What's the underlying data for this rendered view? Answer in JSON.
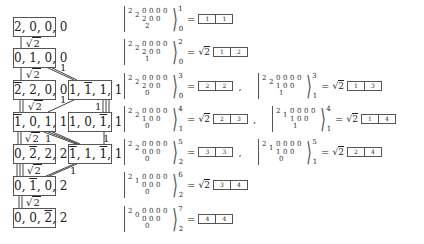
{
  "graph": {
    "nodes": [
      {
        "id": "n1",
        "parts": [
          {
            "t": "2"
          },
          {
            "t": ", 0, 0, 0"
          }
        ],
        "x": 13,
        "y": 17,
        "w": 43
      },
      {
        "id": "n2",
        "parts": [
          {
            "t": "0, 1, 0, 0"
          }
        ],
        "x": 13,
        "y": 48,
        "w": 43
      },
      {
        "id": "n3",
        "parts": [
          {
            "t": "2",
            "bar": true
          },
          {
            "t": ", 2, 0, 0"
          }
        ],
        "x": 13,
        "y": 80,
        "w": 43
      },
      {
        "id": "n4",
        "parts": [
          {
            "t": "1, "
          },
          {
            "t": "1",
            "bar": true
          },
          {
            "t": ", 1, 1"
          }
        ],
        "x": 68,
        "y": 80,
        "w": 44
      },
      {
        "id": "n5",
        "parts": [
          {
            "t": "1",
            "bar": true
          },
          {
            "t": ", 0, 1, 1"
          }
        ],
        "x": 13,
        "y": 112,
        "w": 43
      },
      {
        "id": "n6",
        "parts": [
          {
            "t": "1, 0, "
          },
          {
            "t": "1",
            "bar": true
          },
          {
            "t": ", 1"
          }
        ],
        "x": 68,
        "y": 112,
        "w": 44
      },
      {
        "id": "n7",
        "parts": [
          {
            "t": "0, "
          },
          {
            "t": "2",
            "bar": true
          },
          {
            "t": ", 2, 2"
          }
        ],
        "x": 13,
        "y": 144,
        "w": 43
      },
      {
        "id": "n8",
        "parts": [
          {
            "t": "1",
            "bar": true
          },
          {
            "t": ", 1, "
          },
          {
            "t": "1",
            "bar": true
          },
          {
            "t": ", 1"
          }
        ],
        "x": 68,
        "y": 144,
        "w": 44
      },
      {
        "id": "n9",
        "parts": [
          {
            "t": "0, "
          },
          {
            "t": "1",
            "bar": true
          },
          {
            "t": ", 0, 2"
          }
        ],
        "x": 13,
        "y": 176,
        "w": 43
      },
      {
        "id": "n10",
        "parts": [
          {
            "t": "0, 0, "
          },
          {
            "t": "2",
            "bar": true
          },
          {
            "t": ", 2"
          }
        ],
        "x": 13,
        "y": 208,
        "w": 43
      }
    ],
    "edge_labels": {
      "e12": "√2",
      "e23": "√2",
      "e24": "1",
      "e35": "√2",
      "e45": "1",
      "e46": "1",
      "e57": "√2",
      "e58": "1",
      "e68": "1",
      "e79": "√2",
      "e89": "1",
      "e910": "√2"
    }
  },
  "equations": [
    {
      "id": "eq1",
      "x": 124,
      "y": 5,
      "rows": [
        "2 2 0 0 0 0",
        "2 0 0",
        "2"
      ],
      "sup": "1",
      "sub": "0",
      "coef": "",
      "tableau": [
        "1",
        "1"
      ],
      "comma": false
    },
    {
      "id": "eq2",
      "x": 124,
      "y": 38,
      "rows": [
        "2 2 0 0 0 0",
        "2 0 0",
        "1"
      ],
      "sup": "2",
      "sub": "0",
      "coef": "√2",
      "tableau": [
        "1",
        "2"
      ],
      "comma": false
    },
    {
      "id": "eq3",
      "x": 124,
      "y": 72,
      "rows": [
        "2 2 0 0 0 0",
        "2 0 0",
        "0"
      ],
      "sup": "3",
      "sub": "0",
      "coef": "",
      "tableau": [
        "2",
        "2"
      ],
      "comma": true
    },
    {
      "id": "eq3b",
      "x": 258,
      "y": 72,
      "rows": [
        "2 2 0 0 0 0",
        "1 0 0",
        "1"
      ],
      "sup": "3",
      "sub": "1",
      "coef": "√2",
      "tableau": [
        "1",
        "3"
      ],
      "comma": false
    },
    {
      "id": "eq4",
      "x": 124,
      "y": 105,
      "rows": [
        "2 2 0 0 0 0",
        "1 0 0",
        "0"
      ],
      "sup": "4",
      "sub": "1",
      "coef": "√2",
      "tableau": [
        "2",
        "3"
      ],
      "comma": true
    },
    {
      "id": "eq4b",
      "x": 272,
      "y": 105,
      "rows": [
        "2 1 0 0 0 0",
        "1 0 0",
        "1"
      ],
      "sup": "4",
      "sub": "1",
      "coef": "√2",
      "tableau": [
        "1",
        "4"
      ],
      "comma": false
    },
    {
      "id": "eq5",
      "x": 124,
      "y": 138,
      "rows": [
        "2 2 0 0 0 0",
        "0 0 0",
        "0"
      ],
      "sup": "5",
      "sub": "2",
      "coef": "",
      "tableau": [
        "3",
        "3"
      ],
      "comma": true
    },
    {
      "id": "eq5b",
      "x": 258,
      "y": 138,
      "rows": [
        "2 1 0 0 0 0",
        "1 0 0",
        "0"
      ],
      "sup": "5",
      "sub": "1",
      "coef": "√2",
      "tableau": [
        "2",
        "4"
      ],
      "comma": false
    },
    {
      "id": "eq6",
      "x": 124,
      "y": 171,
      "rows": [
        "2 1 0 0 0 0",
        "0 0 0",
        "0"
      ],
      "sup": "6",
      "sub": "2",
      "coef": "√2",
      "tableau": [
        "3",
        "4"
      ],
      "comma": false
    },
    {
      "id": "eq7",
      "x": 124,
      "y": 205,
      "rows": [
        "2 0 0 0 0 0",
        "0 0 0",
        "0"
      ],
      "sup": "7",
      "sub": "2",
      "coef": "",
      "tableau": [
        "4",
        "4"
      ],
      "comma": false
    }
  ]
}
